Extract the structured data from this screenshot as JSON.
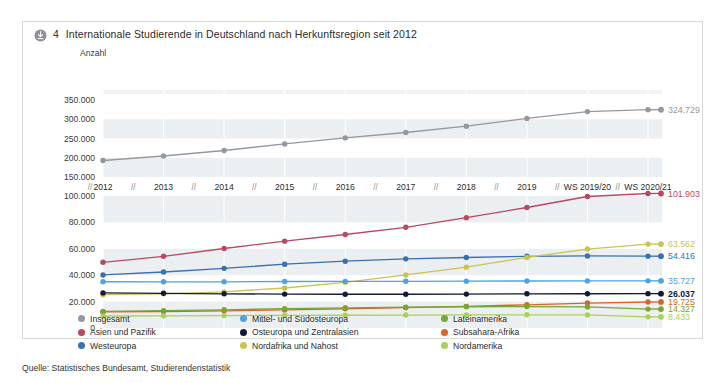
{
  "card": {
    "icon": "download-circle-icon",
    "number": "4",
    "title": "Internationale Studierende in Deutschland nach Herkunftsregion seit 2012"
  },
  "source": "Quelle: Statistisches Bundesamt, Studierendenstatistik",
  "axis_unit": "Anzahl",
  "legend": [
    {
      "label": "Insgesamt",
      "color": "#9499a0"
    },
    {
      "label": "Mittel- und Südosteuropa",
      "color": "#4ea3e0"
    },
    {
      "label": "Lateinamerika",
      "color": "#74a82e"
    },
    {
      "label": "Asien und Pazifik",
      "color": "#b74a63"
    },
    {
      "label": "Osteuropa und Zentralasien",
      "color": "#111a3a"
    },
    {
      "label": "Subsahara-Afrika",
      "color": "#d9632a"
    },
    {
      "label": "Westeuropa",
      "color": "#3a6fb0"
    },
    {
      "label": "Nordafrika und Nahost",
      "color": "#c8c452"
    },
    {
      "label": "Nordamerika",
      "color": "#a9d159"
    }
  ],
  "chart_data": {
    "type": "line",
    "title": "Internationale Studierende in Deutschland nach Herkunftsregion seit 2012",
    "xlabel": "",
    "ylabel": "Anzahl",
    "grid": true,
    "legend_position": "bottom",
    "broken_axis": true,
    "x": [
      "2012",
      "2013",
      "2014",
      "2015",
      "2016",
      "2017",
      "2018",
      "2019",
      "WS 2019/20",
      "WS 2020/21"
    ],
    "x_break_marks": [
      "//",
      "//",
      "//",
      "//",
      "//",
      "//",
      "//",
      "//",
      "//"
    ],
    "top_panel": {
      "yticks": [
        150000,
        200000,
        250000,
        300000,
        350000
      ],
      "yticklabels": [
        "150.000",
        "200.000",
        "250.000",
        "300.000",
        "350.000"
      ],
      "ylim": [
        150000,
        350000
      ]
    },
    "bottom_panel": {
      "yticks": [
        0,
        20000,
        40000,
        60000,
        80000,
        100000
      ],
      "yticklabels": [
        "0",
        "20.000",
        "40.000",
        "60.000",
        "80.000",
        "100.000"
      ],
      "ylim": [
        0,
        100000
      ]
    },
    "series": [
      {
        "name": "Insgesamt",
        "color": "#9499a0",
        "panel": "top",
        "values": [
          192853,
          204644,
          218848,
          235858,
          251542,
          265484,
          282002,
          302157,
          319902,
          324729
        ],
        "end_label": "324.729"
      },
      {
        "name": "Asien und Pazifik",
        "color": "#b74a63",
        "panel": "bottom",
        "values": [
          49800,
          54300,
          60200,
          65800,
          70800,
          76300,
          83600,
          91300,
          99600,
          101903
        ],
        "end_label": "101.903"
      },
      {
        "name": "Westeuropa",
        "color": "#3a6fb0",
        "panel": "bottom",
        "values": [
          40200,
          42400,
          45200,
          48300,
          50600,
          52400,
          53400,
          54300,
          54600,
          54416
        ],
        "end_label": "54.416"
      },
      {
        "name": "Nordafrika und Nahost",
        "color": "#c8c452",
        "panel": "bottom",
        "values": [
          25200,
          25900,
          27400,
          30300,
          34600,
          40200,
          46100,
          53500,
          59800,
          63562
        ],
        "end_label": "63.562"
      },
      {
        "name": "Mittel- und Südosteuropa",
        "color": "#4ea3e0",
        "panel": "bottom",
        "values": [
          35100,
          35000,
          35000,
          35200,
          35300,
          35400,
          35500,
          35600,
          35700,
          35727
        ],
        "end_label": "35.727"
      },
      {
        "name": "Osteuropa und Zentralasien",
        "color": "#111a3a",
        "panel": "bottom",
        "values": [
          26600,
          26300,
          25900,
          25700,
          25600,
          25600,
          25700,
          25900,
          26000,
          26037
        ],
        "end_label": "26.037"
      },
      {
        "name": "Subsahara-Afrika",
        "color": "#d9632a",
        "panel": "bottom",
        "values": [
          12200,
          12500,
          13000,
          13700,
          14500,
          15400,
          16400,
          17600,
          18900,
          19725
        ],
        "end_label": "19.725"
      },
      {
        "name": "Lateinamerika",
        "color": "#74a82e",
        "panel": "bottom",
        "values": [
          12600,
          13100,
          13800,
          14600,
          15300,
          15800,
          16100,
          16200,
          16000,
          14327
        ],
        "end_label": "14.327"
      },
      {
        "name": "Nordamerika",
        "color": "#a9d159",
        "panel": "bottom",
        "values": [
          9100,
          9200,
          9400,
          9600,
          9700,
          9800,
          9900,
          10000,
          9900,
          8433
        ],
        "end_label": "8.433"
      }
    ]
  }
}
